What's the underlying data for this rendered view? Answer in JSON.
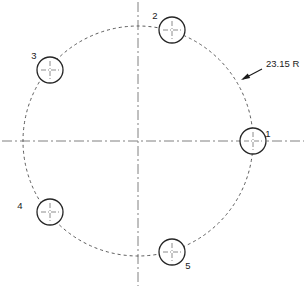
{
  "drawing": {
    "title": "Bolt Hole Circle Pattern",
    "canvas": {
      "width": 306,
      "height": 288,
      "background": "#ffffff"
    },
    "colors": {
      "hole_stroke": "#262626",
      "bolt_circle_stroke": "#4a4a4a",
      "centerline_stroke": "#808080",
      "leader_stroke": "#1a1a1a",
      "text": "#1a1a1a"
    },
    "center": {
      "x": 138,
      "y": 141
    },
    "bolt_circle": {
      "radius_px": 115,
      "style": "dashed",
      "dash_pattern": "3,3"
    },
    "hole_radius_px": 13,
    "holes": [
      {
        "id": "1",
        "label": "1",
        "angle_deg": 0,
        "cx": 253,
        "cy": 141,
        "label_x": 268,
        "label_y": 130
      },
      {
        "id": "2",
        "label": "2",
        "angle_deg": 72,
        "cx": 172,
        "cy": 30,
        "label_x": 155,
        "label_y": 12
      },
      {
        "id": "3",
        "label": "3",
        "angle_deg": 144,
        "cx": 50,
        "cy": 70,
        "label_x": 34,
        "label_y": 52
      },
      {
        "id": "4",
        "label": "4",
        "angle_deg": 216,
        "cx": 50,
        "cy": 212,
        "label_x": 20,
        "label_y": 202
      },
      {
        "id": "5",
        "label": "5",
        "angle_deg": 288,
        "cx": 172,
        "cy": 252,
        "label_x": 188,
        "label_y": 262
      }
    ],
    "centerlines": [
      {
        "id": "horizontal",
        "orientation": "horizontal",
        "x1": 2,
        "y1": 141,
        "x2": 304,
        "y2": 141
      },
      {
        "id": "vertical",
        "orientation": "vertical",
        "x1": 138,
        "y1": 2,
        "x2": 138,
        "y2": 286
      }
    ],
    "centerline_dash": "10,3,2,3",
    "hole_center_mark_len": 9,
    "dimension": {
      "id": "bolt-circle-radius",
      "value": "23.15 R",
      "text_x": 266,
      "text_y": 67,
      "leader": {
        "x1": 262,
        "y1": 69,
        "x2": 243,
        "y2": 79
      },
      "arrow_tip": {
        "x": 241,
        "y": 80
      }
    }
  }
}
